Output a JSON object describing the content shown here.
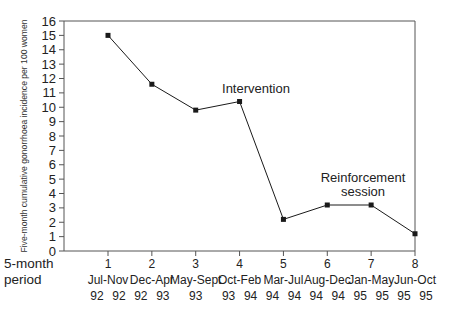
{
  "chart_data": {
    "type": "line",
    "title": "",
    "xlabel": "5-month period",
    "ylabel": "Five-month cumulative gonorrhoea incidence per 100 women",
    "ylim": [
      0,
      16
    ],
    "yticks": [
      0,
      1,
      2,
      3,
      4,
      5,
      6,
      7,
      8,
      9,
      10,
      11,
      12,
      13,
      14,
      15,
      16
    ],
    "grid": false,
    "legend": null,
    "categories": [
      "1",
      "2",
      "3",
      "4",
      "5",
      "6",
      "7",
      "8"
    ],
    "category_periods": [
      {
        "num": "1",
        "range": "Jul-Nov",
        "years": [
          "92",
          "92"
        ]
      },
      {
        "num": "2",
        "range": "Dec-Apr",
        "years": [
          "92",
          "93"
        ]
      },
      {
        "num": "3",
        "range": "May-Sept",
        "years": [
          "93"
        ]
      },
      {
        "num": "4",
        "range": "Oct-Feb",
        "years": [
          "93",
          "94"
        ]
      },
      {
        "num": "5",
        "range": "Mar-Jul",
        "years": [
          "94",
          "94"
        ]
      },
      {
        "num": "6",
        "range": "Aug-Dec",
        "years": [
          "94",
          "94"
        ]
      },
      {
        "num": "7",
        "range": "Jan-May",
        "years": [
          "95",
          "95"
        ]
      },
      {
        "num": "8",
        "range": "Jun-Oct",
        "years": [
          "95",
          "95"
        ]
      }
    ],
    "series": [
      {
        "name": "Gonorrhoea incidence",
        "values": [
          15.0,
          11.6,
          9.8,
          10.4,
          2.2,
          3.2,
          3.2,
          1.2
        ],
        "marker": "square",
        "color": "#1a1a1a"
      }
    ],
    "annotations": [
      {
        "text": "Intervention",
        "at_category": "4"
      },
      {
        "text": "Reinforcement session",
        "lines": [
          "Reinforcement",
          "session"
        ],
        "at_category": "7"
      }
    ]
  },
  "axis_title_left": {
    "line1": "5-month",
    "line2": "period"
  },
  "colors": {
    "line": "#1a1a1a",
    "axis": "#555555",
    "background": "#ffffff"
  }
}
